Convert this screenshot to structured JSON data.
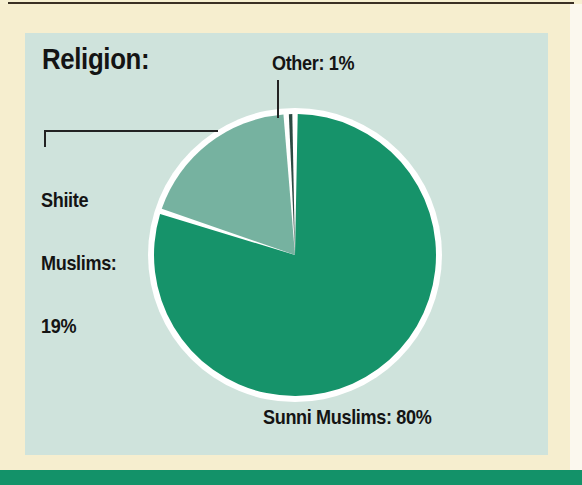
{
  "figure": {
    "title": "Religion:",
    "panel_bg": "#cfe3dc",
    "page_bg": "#f6eecf",
    "bottom_band_color": "#139269"
  },
  "labels": {
    "other": "Other: 1%",
    "shiite_line1": "Shiite",
    "shiite_line2": "Muslims:",
    "shiite_line3": "19%",
    "sunni": "Sunni Muslims: 80%"
  },
  "chart_data": {
    "type": "pie",
    "title": "Religion:",
    "xlabel": "",
    "ylabel": "",
    "categories": [
      "Sunni Muslims",
      "Shiite Muslims",
      "Other"
    ],
    "values": [
      80,
      19,
      1
    ],
    "value_unit": "%",
    "labels": [
      "Sunni Muslims: 80%",
      "Shiite Muslims: 19%",
      "Other: 1%"
    ],
    "colors": [
      "#16936a",
      "#76b2a0",
      "#2c4a42"
    ],
    "slice_separator_color": "#ffffff",
    "start_angle_deg": 0,
    "direction": "clockwise",
    "legend": "callout-labels",
    "grid": false,
    "annotations": [
      {
        "text": "Other: 1%",
        "position": "top",
        "leader": "vertical"
      },
      {
        "text": "Shiite Muslims: 19%",
        "position": "left",
        "leader": "elbow-horizontal"
      },
      {
        "text": "Sunni Muslims: 80%",
        "position": "bottom",
        "leader": "none"
      }
    ]
  }
}
